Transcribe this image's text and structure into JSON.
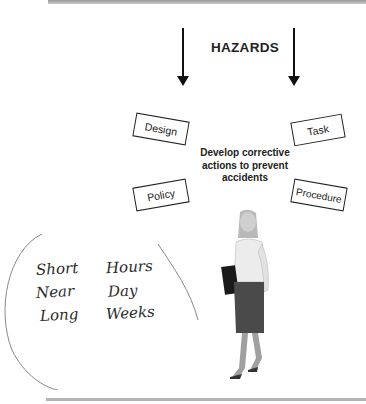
{
  "diagram": {
    "title": "HAZARDS",
    "center_text": "Develop corrective actions to prevent accidents",
    "center_lines": [
      "Develop corrective",
      "actions to prevent",
      "accidents"
    ],
    "boxes": [
      {
        "label": "Design"
      },
      {
        "label": "Task"
      },
      {
        "label": "Policy"
      },
      {
        "label": "Procedure"
      }
    ]
  },
  "handwritten_notes": {
    "rows": [
      {
        "term": "Short",
        "duration": "Hours"
      },
      {
        "term": "Near",
        "duration": "Day"
      },
      {
        "term": "Long",
        "duration": "Weeks"
      }
    ]
  },
  "illustration": {
    "description": "woman-walking-with-folder"
  },
  "colors": {
    "ink": "#222222",
    "rule": "#b4b4b4"
  }
}
